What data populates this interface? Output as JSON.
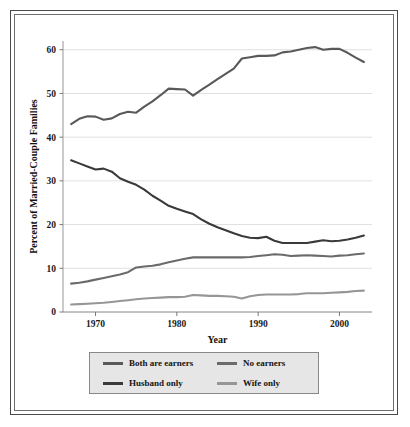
{
  "chart_data": {
    "type": "line",
    "title": "",
    "xlabel": "Year",
    "ylabel": "Percent of Married-Couple Families",
    "xlim": [
      1966,
      2004
    ],
    "ylim": [
      0,
      62
    ],
    "grid": true,
    "legend_position": "bottom",
    "y_ticks": [
      0,
      10,
      20,
      30,
      40,
      50,
      60
    ],
    "y_tick_labels": [
      "0",
      "10",
      "20",
      "30",
      "40",
      "50",
      "60"
    ],
    "x_ticks": [
      1970,
      1980,
      1990,
      2000
    ],
    "x_tick_labels": [
      "1970",
      "1980",
      "1990",
      "2000"
    ],
    "x": [
      1967,
      1968,
      1969,
      1970,
      1971,
      1972,
      1973,
      1974,
      1975,
      1976,
      1977,
      1978,
      1979,
      1980,
      1981,
      1982,
      1983,
      1984,
      1985,
      1986,
      1987,
      1988,
      1989,
      1990,
      1991,
      1992,
      1993,
      1994,
      1995,
      1996,
      1997,
      1998,
      1999,
      2000,
      2001,
      2002,
      2003
    ],
    "series": [
      {
        "name": "Both are earners",
        "color": "#595959",
        "values": [
          43.0,
          44.2,
          44.8,
          44.7,
          44.0,
          44.3,
          45.3,
          45.8,
          45.6,
          47.0,
          48.2,
          49.6,
          51.1,
          51.0,
          50.9,
          49.5,
          50.8,
          52.0,
          53.3,
          54.5,
          55.7,
          58.0,
          58.3,
          58.6,
          58.6,
          58.7,
          59.4,
          59.6,
          60.0,
          60.4,
          60.6,
          60.0,
          60.2,
          60.2,
          59.3,
          58.2,
          57.2
        ]
      },
      {
        "name": "Husband only",
        "color": "#3a3a3a",
        "values": [
          34.7,
          34.0,
          33.3,
          32.6,
          32.8,
          32.1,
          30.6,
          29.8,
          29.1,
          28.0,
          26.6,
          25.5,
          24.3,
          23.6,
          23.0,
          22.4,
          21.2,
          20.2,
          19.4,
          18.7,
          18.0,
          17.4,
          17.0,
          16.9,
          17.2,
          16.3,
          15.8,
          15.8,
          15.8,
          15.8,
          16.1,
          16.4,
          16.2,
          16.3,
          16.6,
          17.0,
          17.5
        ]
      },
      {
        "name": "No earners",
        "color": "#6b6b6b",
        "values": [
          6.5,
          6.7,
          7.0,
          7.4,
          7.8,
          8.2,
          8.6,
          9.1,
          10.2,
          10.4,
          10.6,
          10.9,
          11.4,
          11.8,
          12.2,
          12.5,
          12.5,
          12.5,
          12.5,
          12.5,
          12.5,
          12.5,
          12.6,
          12.8,
          13.0,
          13.2,
          13.1,
          12.8,
          12.9,
          13.0,
          12.9,
          12.8,
          12.7,
          12.9,
          13.0,
          13.2,
          13.4
        ]
      },
      {
        "name": "Wife only",
        "color": "#969696",
        "values": [
          1.7,
          1.8,
          1.9,
          2.0,
          2.1,
          2.3,
          2.5,
          2.7,
          2.9,
          3.1,
          3.2,
          3.3,
          3.4,
          3.4,
          3.5,
          3.9,
          3.8,
          3.7,
          3.7,
          3.6,
          3.5,
          3.1,
          3.6,
          3.9,
          4.0,
          4.0,
          4.0,
          4.0,
          4.1,
          4.3,
          4.3,
          4.3,
          4.4,
          4.5,
          4.6,
          4.8,
          4.9
        ]
      }
    ]
  },
  "legend": {
    "entries": [
      {
        "label": "Both are earners",
        "color": "#595959"
      },
      {
        "label": "No earners",
        "color": "#6b6b6b"
      },
      {
        "label": "Husband only",
        "color": "#3a3a3a"
      },
      {
        "label": "Wife only",
        "color": "#969696"
      }
    ]
  }
}
